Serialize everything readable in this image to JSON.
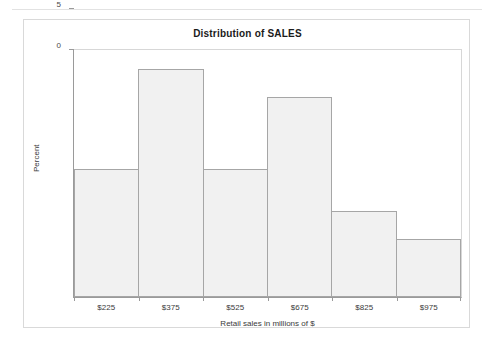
{
  "chart_data": {
    "type": "bar",
    "title": "Distribution of SALES",
    "xlabel": "Retail sales in millions of $",
    "ylabel": "Percent",
    "categories": [
      "$225",
      "$375",
      "$525",
      "$675",
      "$825",
      "$975"
    ],
    "values": [
      15.5,
      27.7,
      15.5,
      24.3,
      10.5,
      7.1
    ],
    "ylim": [
      0,
      30
    ],
    "yticks": [
      0,
      5,
      10,
      15,
      20,
      25,
      30
    ],
    "ytick_labels": [
      "0",
      "5",
      "10",
      "15",
      "20",
      "25",
      "30"
    ],
    "grid": false,
    "legend": null,
    "bar_fill_color": "#f1f1f1",
    "bar_border_color": "#a6a6a6",
    "axis_color": "#9a9a9a",
    "text_color": "#3a3a3a"
  }
}
